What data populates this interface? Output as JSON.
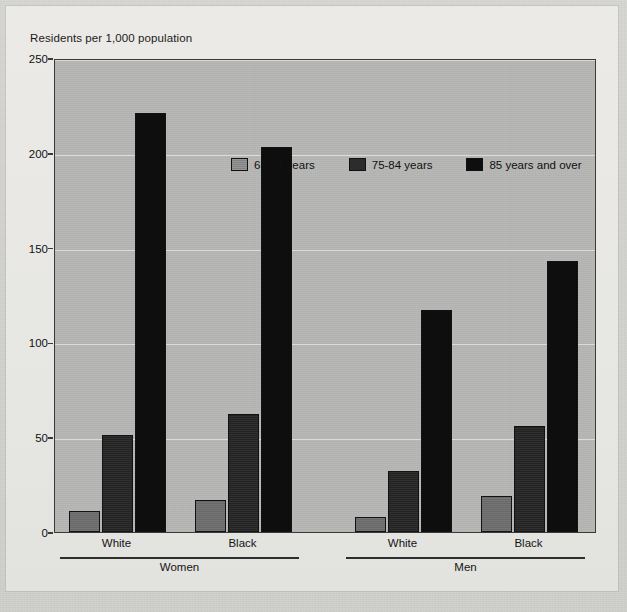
{
  "figure": {
    "y_axis_title": "Residents per 1,000 population"
  },
  "legend": {
    "items": [
      {
        "label": "65-74 years",
        "swatch": "legend-swatch-65-74"
      },
      {
        "label": "75-84 years",
        "swatch": "legend-swatch-75-84"
      },
      {
        "label": "85 years and over",
        "swatch": "legend-swatch-85-over"
      }
    ]
  },
  "x_axis": {
    "categories": [
      "White",
      "Black",
      "White",
      "Black"
    ],
    "groups": [
      "Women",
      "Men"
    ]
  },
  "y_axis": {
    "ticks": [
      "0",
      "50",
      "100",
      "150",
      "200",
      "250"
    ]
  },
  "ghost_text": {
    "top_mid": "the health status of people continues to improve\nand the number of the very old increases",
    "top_right": "economic status affects the health of people\n(11). Differences in health by socioeconomic\nstatus have been well documented and have\npersisted over time. Health status, whether\nmeasured by mortality, morbidity, or self-\nassessed health status, varies with education\nand income.",
    "left": "hundred of nursing home residents\nper 1,000 population of persons 65 years of age and\nover, by age, sex, and race in the United States.\nThe rates of nursing home use increase sharply\nwith age for both men and women of all races.",
    "bottom_right": "elderly 65 years of age in 1997 the older population\nbelow poverty level (1.9) children (below 18 years"
  },
  "chart_data": {
    "type": "bar",
    "title": "",
    "ylabel": "Residents per 1,000 population",
    "xlabel": "",
    "ylim": [
      0,
      250
    ],
    "yticks": [
      0,
      50,
      100,
      150,
      200,
      250
    ],
    "grid": true,
    "legend_position": "top-center-inside",
    "categories": [
      "Women / White",
      "Women / Black",
      "Men / White",
      "Men / Black"
    ],
    "groups": [
      {
        "name": "Women",
        "categories": [
          "White",
          "Black"
        ]
      },
      {
        "name": "Men",
        "categories": [
          "White",
          "Black"
        ]
      }
    ],
    "series": [
      {
        "name": "65-74 years",
        "color": "#6e6e6e",
        "values": [
          11,
          17,
          8,
          19
        ]
      },
      {
        "name": "75-84 years",
        "color": "#242424",
        "values": [
          51,
          62,
          32,
          56
        ]
      },
      {
        "name": "85 years and over",
        "color": "#0e0e0e",
        "values": [
          221,
          203,
          117,
          143
        ]
      }
    ]
  }
}
